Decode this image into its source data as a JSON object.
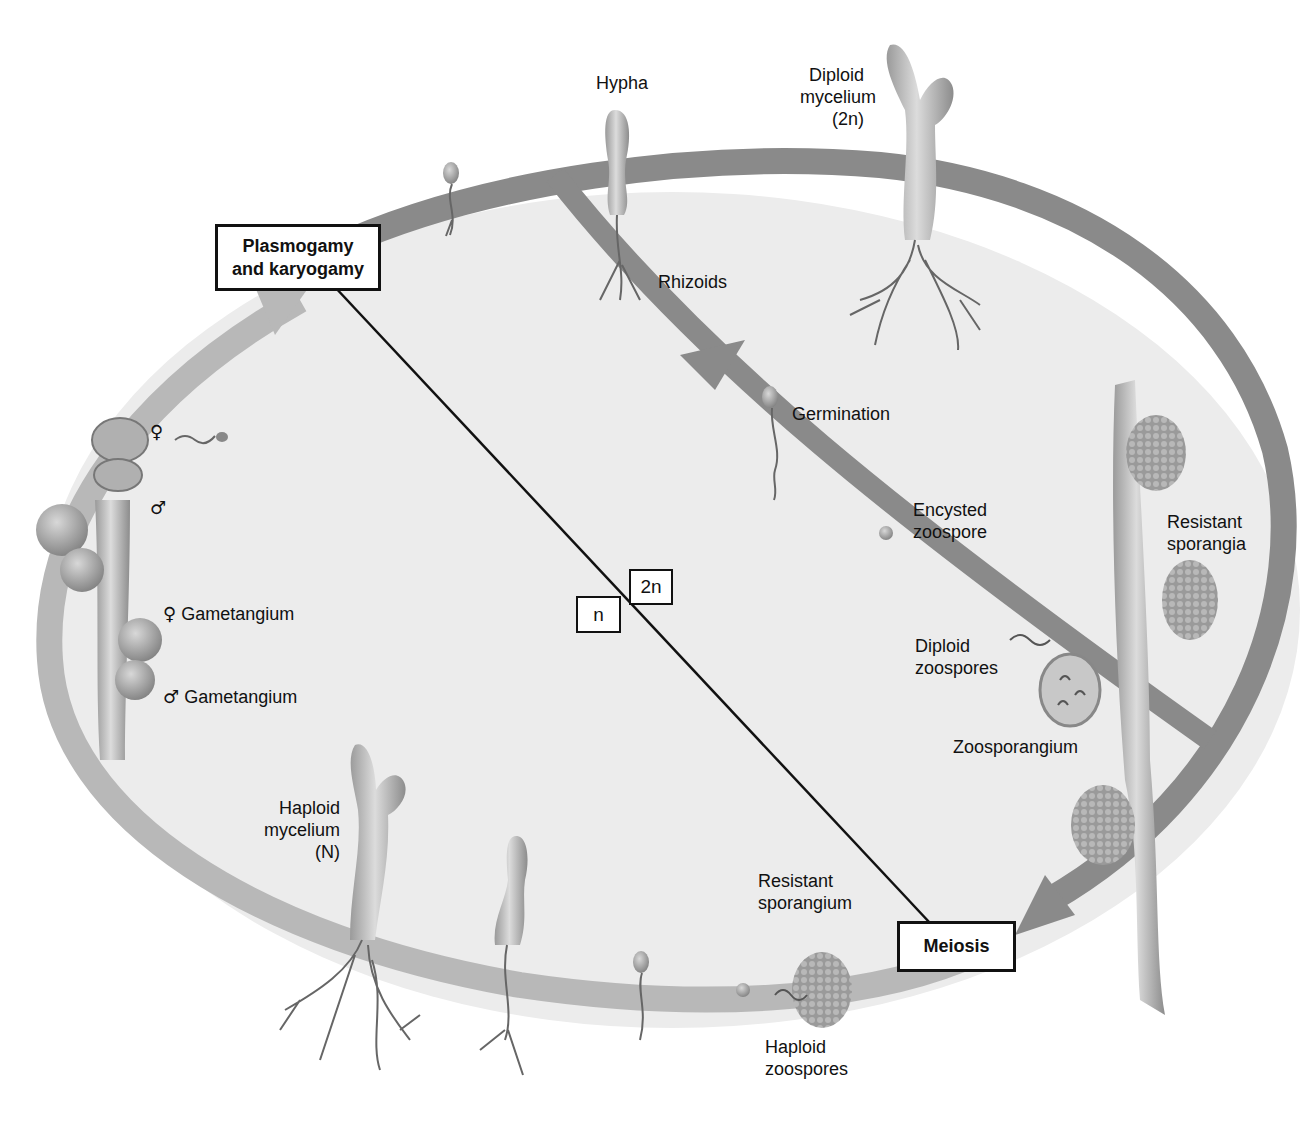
{
  "diagram": {
    "colors": {
      "diploid_band": "#8a8a8a",
      "haploid_band": "#b8b8b8",
      "interior": "#ececec",
      "background": "#ffffff",
      "text": "#111111"
    },
    "process_boxes": {
      "plasmogamy": {
        "line1": "Plasmogamy",
        "line2": "and karyogamy"
      },
      "meiosis": "Meiosis"
    },
    "ploidy_boxes": {
      "haploid": "n",
      "diploid": "2n"
    },
    "labels": {
      "hypha": "Hypha",
      "diploid_mycelium": {
        "line1": "Diploid",
        "line2": "mycelium",
        "line3": "(2n)"
      },
      "rhizoids": "Rhizoids",
      "germination": "Germination",
      "encysted_zoospore": {
        "line1": "Encysted",
        "line2": "zoospore"
      },
      "resistant_sporangia": {
        "line1": "Resistant",
        "line2": "sporangia"
      },
      "diploid_zoospores": {
        "line1": "Diploid",
        "line2": "zoospores"
      },
      "zoosporangium": "Zoosporangium",
      "resistant_sporangium": {
        "line1": "Resistant",
        "line2": "sporangium"
      },
      "haploid_zoospores": {
        "line1": "Haploid",
        "line2": "zoospores"
      },
      "haploid_mycelium": {
        "line1": "Haploid",
        "line2": "mycelium",
        "line3": "(N)"
      },
      "female_gametangium": {
        "symbol": "♀",
        "text": "Gametangium"
      },
      "male_gametangium": {
        "symbol": "♂",
        "text": "Gametangium"
      },
      "female_symbol": "♀",
      "male_symbol": "♂"
    }
  }
}
